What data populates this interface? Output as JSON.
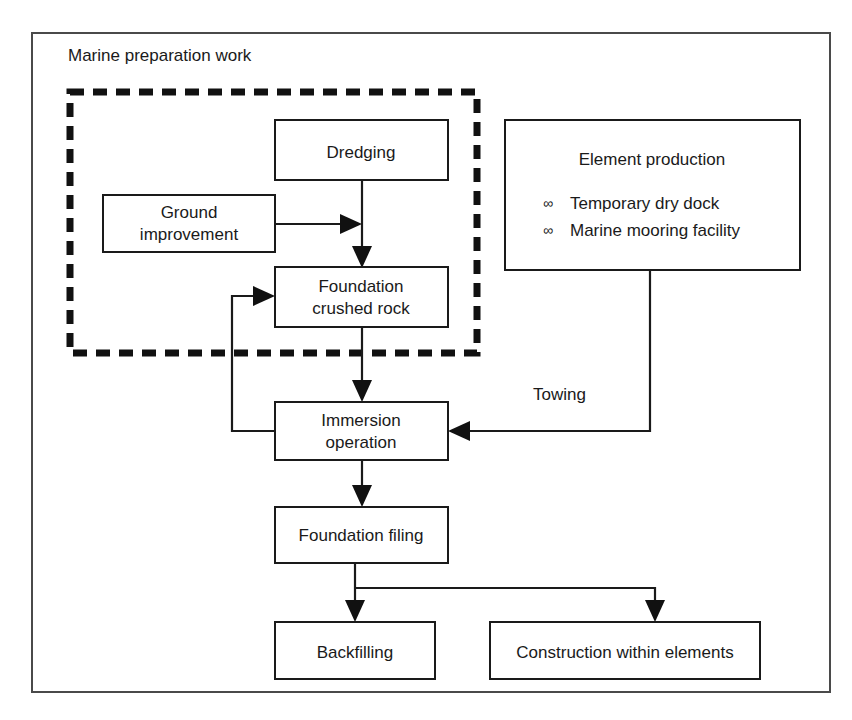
{
  "diagram": {
    "title": "Marine preparation work",
    "group_label": "Marine preparation work",
    "nodes": {
      "dredging": "Dredging",
      "ground_improvement_line1": "Ground",
      "ground_improvement_line2": "improvement",
      "foundation_crushed_rock_line1": "Foundation",
      "foundation_crushed_rock_line2": "crushed rock",
      "immersion_operation_line1": "Immersion",
      "immersion_operation_line2": "operation",
      "foundation_filing": "Foundation filing",
      "backfilling": "Backfilling",
      "construction_within_elements": "Construction within elements",
      "element_production_title": "Element production",
      "element_production_item1": "Temporary dry dock",
      "element_production_item2": "Marine mooring facility",
      "element_production_bullet": "∞"
    },
    "edge_labels": {
      "towing": "Towing"
    },
    "colors": {
      "stroke": "#1a1a1a",
      "frame": "#4a4a4a",
      "dashed": "#111111",
      "background": "#ffffff"
    }
  }
}
